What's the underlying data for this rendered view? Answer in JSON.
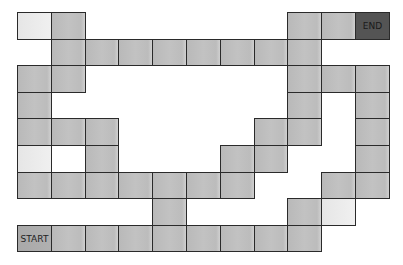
{
  "board": {
    "grid": {
      "origin_x": 17,
      "origin_y": 12,
      "cell_w": 33.8,
      "cell_h": 26.6,
      "cols": 11,
      "rows": 9
    },
    "colors": {
      "cell": "#bdbdbd",
      "light": "#ececec",
      "blank": "#ffffff",
      "start": "#aaaaaa",
      "end": "#545454",
      "border": "#2a2a2a"
    },
    "start_label": "START",
    "end_label": "END",
    "cells": [
      {
        "r": 0,
        "c": 0,
        "t": "light"
      },
      {
        "r": 0,
        "c": 1,
        "t": "cell"
      },
      {
        "r": 0,
        "c": 8,
        "t": "cell"
      },
      {
        "r": 0,
        "c": 9,
        "t": "cell"
      },
      {
        "r": 0,
        "c": 10,
        "t": "end"
      },
      {
        "r": 1,
        "c": 1,
        "t": "cell"
      },
      {
        "r": 1,
        "c": 2,
        "t": "cell"
      },
      {
        "r": 1,
        "c": 3,
        "t": "cell"
      },
      {
        "r": 1,
        "c": 4,
        "t": "cell"
      },
      {
        "r": 1,
        "c": 5,
        "t": "cell"
      },
      {
        "r": 1,
        "c": 6,
        "t": "cell"
      },
      {
        "r": 1,
        "c": 7,
        "t": "cell"
      },
      {
        "r": 1,
        "c": 8,
        "t": "cell"
      },
      {
        "r": 2,
        "c": 0,
        "t": "cell"
      },
      {
        "r": 2,
        "c": 1,
        "t": "cell"
      },
      {
        "r": 2,
        "c": 8,
        "t": "cell"
      },
      {
        "r": 2,
        "c": 9,
        "t": "cell"
      },
      {
        "r": 2,
        "c": 10,
        "t": "cell"
      },
      {
        "r": 3,
        "c": 0,
        "t": "cell"
      },
      {
        "r": 3,
        "c": 8,
        "t": "cell"
      },
      {
        "r": 3,
        "c": 10,
        "t": "cell"
      },
      {
        "r": 4,
        "c": 0,
        "t": "cell"
      },
      {
        "r": 4,
        "c": 1,
        "t": "cell"
      },
      {
        "r": 4,
        "c": 2,
        "t": "cell"
      },
      {
        "r": 4,
        "c": 7,
        "t": "cell"
      },
      {
        "r": 4,
        "c": 8,
        "t": "cell"
      },
      {
        "r": 4,
        "c": 10,
        "t": "cell"
      },
      {
        "r": 5,
        "c": 0,
        "t": "light"
      },
      {
        "r": 5,
        "c": 1,
        "t": "blank"
      },
      {
        "r": 5,
        "c": 2,
        "t": "cell"
      },
      {
        "r": 5,
        "c": 6,
        "t": "cell"
      },
      {
        "r": 5,
        "c": 7,
        "t": "cell"
      },
      {
        "r": 5,
        "c": 10,
        "t": "cell"
      },
      {
        "r": 6,
        "c": 0,
        "t": "cell"
      },
      {
        "r": 6,
        "c": 1,
        "t": "cell"
      },
      {
        "r": 6,
        "c": 2,
        "t": "cell"
      },
      {
        "r": 6,
        "c": 3,
        "t": "cell"
      },
      {
        "r": 6,
        "c": 4,
        "t": "cell"
      },
      {
        "r": 6,
        "c": 5,
        "t": "cell"
      },
      {
        "r": 6,
        "c": 6,
        "t": "cell"
      },
      {
        "r": 6,
        "c": 9,
        "t": "cell"
      },
      {
        "r": 6,
        "c": 10,
        "t": "cell"
      },
      {
        "r": 7,
        "c": 4,
        "t": "cell"
      },
      {
        "r": 7,
        "c": 8,
        "t": "cell"
      },
      {
        "r": 7,
        "c": 9,
        "t": "light"
      },
      {
        "r": 8,
        "c": 0,
        "t": "start"
      },
      {
        "r": 8,
        "c": 1,
        "t": "cell"
      },
      {
        "r": 8,
        "c": 2,
        "t": "cell"
      },
      {
        "r": 8,
        "c": 3,
        "t": "cell"
      },
      {
        "r": 8,
        "c": 4,
        "t": "cell"
      },
      {
        "r": 8,
        "c": 5,
        "t": "cell"
      },
      {
        "r": 8,
        "c": 6,
        "t": "cell"
      },
      {
        "r": 8,
        "c": 7,
        "t": "cell"
      },
      {
        "r": 8,
        "c": 8,
        "t": "cell"
      }
    ]
  }
}
